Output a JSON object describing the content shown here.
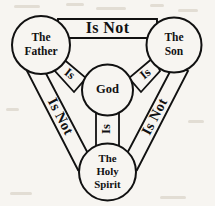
{
  "diagram": {
    "nodes": {
      "father": {
        "line1": "The",
        "line2": "Father"
      },
      "son": {
        "line1": "The",
        "line2": "Son"
      },
      "holy_spirit": {
        "line1": "The",
        "line2": "Holy",
        "line3": "Spirit"
      },
      "center": {
        "label": "God"
      }
    },
    "bands": {
      "top": {
        "label": "Is Not",
        "from": "father",
        "to": "son"
      },
      "left": {
        "label": "Is Not",
        "from": "father",
        "to": "holy_spirit"
      },
      "right": {
        "label": "Is Not",
        "from": "son",
        "to": "holy_spirit"
      }
    },
    "spokes": {
      "left": {
        "label": "Is",
        "from": "father",
        "to": "center"
      },
      "right": {
        "label": "Is",
        "from": "son",
        "to": "center"
      },
      "bottom": {
        "label": "Is",
        "from": "holy_spirit",
        "to": "center"
      }
    },
    "colors": {
      "ink": "#111111",
      "paper": "#f7f5f1"
    }
  }
}
